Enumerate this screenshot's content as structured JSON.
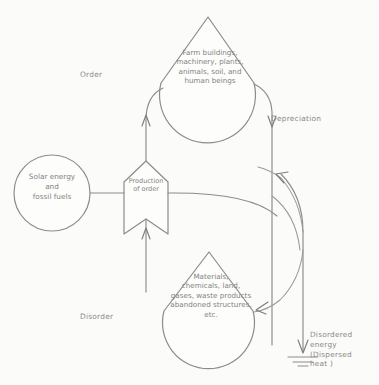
{
  "diagram": {
    "medium": "pencil sketch on white paper",
    "ink_color": "#8d8c8a",
    "paper_color": "#fbfbfa",
    "nodes": {
      "source": {
        "name": "solar-energy-source",
        "shape": "circle",
        "text": "Solar energy\nand\nfossil fuels"
      },
      "converter": {
        "name": "production-of-order",
        "shape": "banner",
        "text": "Production\nof order"
      },
      "order_store": {
        "name": "order-store",
        "shape": "teardrop",
        "text": "Farm buildings,\nmachinery, plants,\nanimals, soil, and\nhuman beings"
      },
      "disorder_store": {
        "name": "disorder-store",
        "shape": "teardrop",
        "text": "Materials,\nchemicals, land,\ngases, waste products\nabandoned structures,\netc."
      }
    },
    "labels": {
      "order": "Order",
      "disorder": "Disorder",
      "depreciation": "Depreciation",
      "sink": "Disordered\nenergy\n(Dispersed\nheat )"
    },
    "flows": [
      {
        "name": "source-to-converter",
        "from": "source",
        "to": "converter",
        "style": "straight"
      },
      {
        "name": "converter-to-order",
        "from": "converter",
        "to": "order_store",
        "style": "curved-up"
      },
      {
        "name": "disorder-to-converter",
        "from": "disorder_store",
        "to": "converter",
        "style": "straight-up"
      },
      {
        "name": "converter-to-right-trunk",
        "from": "converter",
        "to": "heat-sink",
        "style": "curved-right"
      },
      {
        "name": "order-depreciation",
        "from": "order_store",
        "to": "heat-sink",
        "style": "curved-down"
      },
      {
        "name": "recycle-to-disorder",
        "from": "right-trunk",
        "to": "disorder_store",
        "style": "curved-left"
      },
      {
        "name": "heat-dissipation",
        "from": "right-trunk",
        "to": "ground",
        "style": "vertical"
      }
    ],
    "ground_symbol": "earth-ground"
  }
}
